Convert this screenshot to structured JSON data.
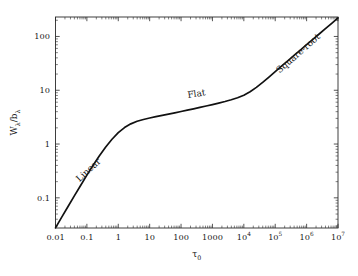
{
  "figure": {
    "background_color": "#ffffff",
    "curve_color": "#111111",
    "axis_color": "#2b2b2b",
    "text_color": "#1a1a1a"
  },
  "axes": {
    "x_title": "τ",
    "x_title_sub": "0",
    "y_title_main": "W",
    "y_title_sub1": "λ",
    "y_title_slash": "/b",
    "y_title_sub2": "λ"
  },
  "x_ticks": [
    {
      "label": "0.01",
      "sup": "",
      "value": 0.01
    },
    {
      "label": "0.1",
      "sup": "",
      "value": 0.1
    },
    {
      "label": "1",
      "sup": "",
      "value": 1
    },
    {
      "label": "10",
      "sup": "",
      "value": 10
    },
    {
      "label": "100",
      "sup": "",
      "value": 100
    },
    {
      "label": "1000",
      "sup": "",
      "value": 1000
    },
    {
      "label": "10",
      "sup": "4",
      "value": 10000
    },
    {
      "label": "10",
      "sup": "5",
      "value": 100000
    },
    {
      "label": "10",
      "sup": "6",
      "value": 1000000
    },
    {
      "label": "10",
      "sup": "7",
      "value": 10000000
    }
  ],
  "y_ticks": [
    {
      "label": "0.1",
      "value": 0.1
    },
    {
      "label": "1",
      "value": 1
    },
    {
      "label": "10",
      "value": 10
    },
    {
      "label": "100",
      "value": 100
    }
  ],
  "annotations": [
    {
      "text": "Linear",
      "x": 0.13,
      "y": 0.3,
      "rotation": -43
    },
    {
      "text": "Flat",
      "x": 320,
      "y": 7.6,
      "rotation": -9
    },
    {
      "text": "Square-root",
      "x": 620000,
      "y": 44,
      "rotation": -41
    }
  ],
  "chart_data": {
    "type": "line",
    "title": "",
    "xlabel": "tau_0",
    "ylabel": "W_lambda / b_lambda",
    "xscale": "log",
    "yscale": "log",
    "xlim": [
      0.01,
      10000000
    ],
    "ylim": [
      0.0275,
      230
    ],
    "grid": false,
    "legend": null,
    "series": [
      {
        "name": "curve of growth",
        "x": [
          0.01,
          0.0158,
          0.0251,
          0.0398,
          0.0631,
          0.1,
          0.158,
          0.251,
          0.398,
          0.631,
          1.0,
          1.58,
          2.51,
          3.98,
          6.31,
          10.0,
          15.8,
          25.1,
          39.8,
          63.1,
          100,
          158,
          251,
          398,
          631,
          1000,
          1580,
          2510,
          3980,
          6310,
          10000,
          15800,
          25100,
          39800,
          63100,
          100000,
          158000,
          251000,
          398000,
          631000,
          1000000,
          1580000,
          2510000,
          3980000,
          6310000,
          10000000
        ],
        "y": [
          0.0277,
          0.0437,
          0.069,
          0.1086,
          0.17,
          0.264,
          0.404,
          0.606,
          0.88,
          1.227,
          1.625,
          2.025,
          2.375,
          2.65,
          2.865,
          3.05,
          3.23,
          3.41,
          3.6,
          3.8,
          4.02,
          4.26,
          4.52,
          4.8,
          5.1,
          5.42,
          5.78,
          6.18,
          6.65,
          7.25,
          8.1,
          9.4,
          11.3,
          14.0,
          17.6,
          22.2,
          28.0,
          35.3,
          44.4,
          55.9,
          70.3,
          88.4,
          111.2,
          139.8,
          175.8,
          221.0
        ]
      }
    ],
    "regimes": [
      {
        "name": "Linear",
        "slope": 1.0,
        "x_range": [
          0.01,
          1
        ]
      },
      {
        "name": "Flat",
        "slope": 0.0,
        "x_range": [
          10,
          3000
        ]
      },
      {
        "name": "Square-root",
        "slope": 0.5,
        "x_range": [
          100000,
          10000000
        ]
      }
    ]
  }
}
